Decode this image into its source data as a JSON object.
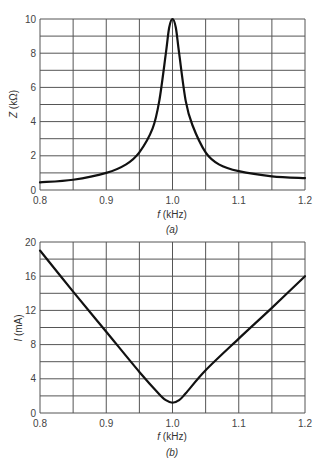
{
  "chart_data": [
    {
      "id": "a",
      "type": "line",
      "caption": "(a)",
      "title": "",
      "xlabel_var": "f",
      "xlabel_unit": " (kHz)",
      "ylabel_var": "Z",
      "ylabel_unit": " (kΩ)",
      "xlim": [
        0.8,
        1.2
      ],
      "ylim": [
        0,
        10
      ],
      "xticks": [
        0.8,
        0.9,
        1.0,
        1.1,
        1.2
      ],
      "xtick_labels": [
        "0.8",
        "0.9",
        "1.0",
        "1.1",
        "1.2"
      ],
      "yticks": [
        0,
        2,
        4,
        6,
        8,
        10
      ],
      "ytick_labels": [
        "0",
        "2",
        "4",
        "6",
        "8",
        "10"
      ],
      "grid": {
        "x_step": 0.05,
        "y_step": 1
      },
      "legend": null,
      "series": [
        {
          "name": "Z",
          "x": [
            0.8,
            0.85,
            0.9,
            0.93,
            0.95,
            0.97,
            0.98,
            0.99,
            0.995,
            1.0,
            1.005,
            1.01,
            1.02,
            1.03,
            1.05,
            1.07,
            1.1,
            1.15,
            1.2
          ],
          "values": [
            0.45,
            0.6,
            1.0,
            1.5,
            2.2,
            3.6,
            5.2,
            8.0,
            9.5,
            10.0,
            9.5,
            8.0,
            5.2,
            3.8,
            2.2,
            1.5,
            1.1,
            0.8,
            0.7
          ]
        }
      ]
    },
    {
      "id": "b",
      "type": "line",
      "caption": "(b)",
      "title": "",
      "xlabel_var": "f",
      "xlabel_unit": " (kHz)",
      "ylabel_var": "I",
      "ylabel_unit": " (mA)",
      "xlim": [
        0.8,
        1.2
      ],
      "ylim": [
        0,
        20
      ],
      "xticks": [
        0.8,
        0.9,
        1.0,
        1.1,
        1.2
      ],
      "xtick_labels": [
        "0.8",
        "0.9",
        "1.0",
        "1.1",
        "1.2"
      ],
      "yticks": [
        0,
        4,
        8,
        12,
        16,
        20
      ],
      "ytick_labels": [
        "0",
        "4",
        "8",
        "12",
        "16",
        "20"
      ],
      "grid": {
        "x_step": 0.05,
        "y_step": 2
      },
      "legend": null,
      "series": [
        {
          "name": "I",
          "x": [
            0.8,
            0.85,
            0.9,
            0.95,
            0.98,
            0.99,
            1.0,
            1.01,
            1.02,
            1.05,
            1.1,
            1.15,
            1.2
          ],
          "values": [
            19.0,
            14.2,
            9.5,
            4.8,
            2.2,
            1.5,
            1.2,
            1.5,
            2.3,
            5.0,
            8.7,
            12.3,
            16.0
          ]
        }
      ]
    }
  ]
}
